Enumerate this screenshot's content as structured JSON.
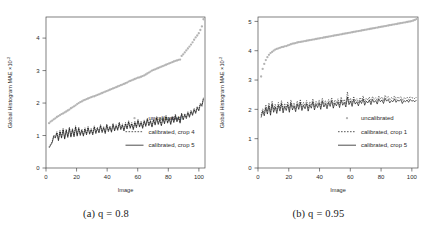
{
  "figure": {
    "panels": [
      {
        "id": "panel-a",
        "caption_label": "(a)",
        "caption_var": "q",
        "caption_eq": "= 0.8",
        "caption_full": "(a) q = 0.8"
      },
      {
        "id": "panel-b",
        "caption_label": "(b)",
        "caption_var": "q",
        "caption_eq": "= 0.95",
        "caption_full": "(b) q = 0.95"
      }
    ]
  },
  "chart_data": [
    {
      "type": "line",
      "panel": "a",
      "title": "",
      "xlabel": "Image",
      "ylabel": "Global Histogram MAE",
      "ylabel_scale": "×10",
      "ylabel_exp": "-2",
      "xlim": [
        0,
        104
      ],
      "ylim": [
        0,
        4.65
      ],
      "xticks": [
        0,
        20,
        40,
        60,
        80,
        100
      ],
      "yticks": [
        0,
        1,
        2,
        3,
        4
      ],
      "grid": false,
      "legend_position": "bottom-right",
      "series": [
        {
          "name": "uncalibrated",
          "style": "points",
          "color": "#b4b4b4",
          "values": [
            1.38,
            1.43,
            1.46,
            1.5,
            1.53,
            1.57,
            1.6,
            1.63,
            1.66,
            1.68,
            1.71,
            1.74,
            1.77,
            1.8,
            1.84,
            1.87,
            1.9,
            1.93,
            1.97,
            2.0,
            2.03,
            2.05,
            2.08,
            2.1,
            2.12,
            2.14,
            2.16,
            2.18,
            2.2,
            2.21,
            2.23,
            2.25,
            2.27,
            2.29,
            2.31,
            2.33,
            2.35,
            2.37,
            2.39,
            2.41,
            2.43,
            2.45,
            2.47,
            2.49,
            2.51,
            2.53,
            2.55,
            2.57,
            2.59,
            2.61,
            2.63,
            2.66,
            2.68,
            2.7,
            2.72,
            2.74,
            2.76,
            2.78,
            2.79,
            2.81,
            2.83,
            2.85,
            2.88,
            2.91,
            2.94,
            2.97,
            3.0,
            3.02,
            3.04,
            3.06,
            3.08,
            3.1,
            3.12,
            3.14,
            3.16,
            3.18,
            3.2,
            3.22,
            3.24,
            3.26,
            3.28,
            3.3,
            3.31,
            3.33,
            3.34,
            3.45,
            3.5,
            3.56,
            3.62,
            3.68,
            3.74,
            3.8,
            3.87,
            3.95,
            4.02,
            4.08,
            4.15,
            4.25,
            4.36,
            4.58
          ]
        },
        {
          "name": "calibrated, crop 4",
          "style": "dotted",
          "color": "#111111",
          "values": [
            0.66,
            0.74,
            0.82,
            1.02,
            0.96,
            1.12,
            0.88,
            1.16,
            0.96,
            1.22,
            0.93,
            1.2,
            0.98,
            1.26,
            0.99,
            1.22,
            1.0,
            1.3,
            1.02,
            1.26,
            1.04,
            1.2,
            1.02,
            1.24,
            1.06,
            1.28,
            1.08,
            1.22,
            1.06,
            1.3,
            1.1,
            1.26,
            1.12,
            1.34,
            1.13,
            1.28,
            1.1,
            1.36,
            1.16,
            1.3,
            1.14,
            1.38,
            1.18,
            1.34,
            1.2,
            1.42,
            1.22,
            1.36,
            1.18,
            1.4,
            1.24,
            1.46,
            1.26,
            1.4,
            1.22,
            1.44,
            1.28,
            1.5,
            1.3,
            1.44,
            1.26,
            1.48,
            1.32,
            1.54,
            1.34,
            1.48,
            1.3,
            1.52,
            1.36,
            1.58,
            1.38,
            1.52,
            1.34,
            1.56,
            1.4,
            1.62,
            1.42,
            1.56,
            1.38,
            1.6,
            1.44,
            1.66,
            1.46,
            1.6,
            1.42,
            1.7,
            1.52,
            1.68,
            1.56,
            1.74,
            1.6,
            1.78,
            1.66,
            1.84,
            1.72,
            1.9,
            1.8,
            2.0,
            1.94,
            2.18
          ]
        },
        {
          "name": "calibrated, crop 5",
          "style": "solid",
          "color": "#000000",
          "values": [
            0.62,
            0.7,
            0.78,
            0.98,
            0.92,
            1.08,
            0.84,
            1.12,
            0.92,
            1.18,
            0.89,
            1.16,
            0.94,
            1.22,
            0.95,
            1.18,
            0.96,
            1.26,
            0.98,
            1.22,
            1.0,
            1.16,
            0.98,
            1.2,
            1.02,
            1.24,
            1.04,
            1.18,
            1.02,
            1.26,
            1.06,
            1.22,
            1.08,
            1.3,
            1.09,
            1.24,
            1.06,
            1.32,
            1.12,
            1.26,
            1.1,
            1.34,
            1.14,
            1.3,
            1.16,
            1.38,
            1.18,
            1.32,
            1.14,
            1.36,
            1.2,
            1.42,
            1.22,
            1.36,
            1.18,
            1.4,
            1.24,
            1.46,
            1.26,
            1.4,
            1.22,
            1.44,
            1.28,
            1.5,
            1.3,
            1.44,
            1.26,
            1.48,
            1.32,
            1.54,
            1.34,
            1.48,
            1.3,
            1.52,
            1.36,
            1.58,
            1.38,
            1.52,
            1.34,
            1.56,
            1.4,
            1.62,
            1.42,
            1.56,
            1.38,
            1.66,
            1.48,
            1.64,
            1.52,
            1.7,
            1.56,
            1.74,
            1.62,
            1.8,
            1.68,
            1.86,
            1.76,
            1.96,
            1.9,
            2.14
          ]
        }
      ]
    },
    {
      "type": "line",
      "panel": "b",
      "title": "",
      "xlabel": "Image",
      "ylabel": "Global Histogram MAE",
      "ylabel_scale": "×10",
      "ylabel_exp": "-2",
      "xlim": [
        0,
        104
      ],
      "ylim": [
        0,
        5.15
      ],
      "xticks": [
        0,
        20,
        40,
        60,
        80,
        100
      ],
      "yticks": [
        0,
        1,
        2,
        3,
        4,
        5
      ],
      "grid": false,
      "legend_position": "bottom-right",
      "series": [
        {
          "name": "uncalibrated",
          "style": "points",
          "color": "#b4b4b4",
          "values": [
            3.12,
            3.38,
            3.55,
            3.68,
            3.78,
            3.86,
            3.92,
            3.96,
            4.0,
            4.04,
            4.06,
            4.08,
            4.1,
            4.12,
            4.13,
            4.15,
            4.16,
            4.18,
            4.2,
            4.22,
            4.24,
            4.25,
            4.26,
            4.28,
            4.29,
            4.3,
            4.31,
            4.32,
            4.33,
            4.34,
            4.35,
            4.36,
            4.37,
            4.38,
            4.39,
            4.4,
            4.41,
            4.42,
            4.43,
            4.44,
            4.45,
            4.46,
            4.47,
            4.48,
            4.49,
            4.5,
            4.51,
            4.52,
            4.53,
            4.54,
            4.55,
            4.56,
            4.57,
            4.58,
            4.59,
            4.6,
            4.61,
            4.62,
            4.63,
            4.64,
            4.65,
            4.66,
            4.67,
            4.68,
            4.69,
            4.7,
            4.71,
            4.72,
            4.73,
            4.74,
            4.75,
            4.76,
            4.77,
            4.78,
            4.79,
            4.8,
            4.81,
            4.82,
            4.83,
            4.84,
            4.85,
            4.86,
            4.87,
            4.88,
            4.89,
            4.9,
            4.91,
            4.92,
            4.93,
            4.94,
            4.95,
            4.96,
            4.97,
            4.98,
            4.99,
            5.0,
            5.01,
            5.03,
            5.05,
            5.08
          ]
        },
        {
          "name": "calibrated, crop 1",
          "style": "dotted",
          "color": "#111111",
          "values": [
            1.8,
            2.02,
            1.88,
            2.16,
            1.94,
            2.22,
            1.9,
            2.28,
            2.0,
            2.18,
            1.96,
            2.24,
            2.04,
            2.3,
            1.98,
            2.2,
            2.06,
            2.26,
            2.0,
            2.32,
            2.08,
            2.22,
            2.02,
            2.28,
            2.1,
            2.34,
            2.06,
            2.24,
            2.12,
            2.3,
            2.04,
            2.26,
            2.14,
            2.36,
            2.08,
            2.28,
            2.16,
            2.32,
            2.1,
            2.38,
            2.18,
            2.3,
            2.12,
            2.34,
            2.2,
            2.4,
            2.14,
            2.32,
            2.22,
            2.36,
            2.16,
            2.42,
            2.24,
            2.34,
            2.18,
            2.6,
            2.26,
            2.38,
            2.2,
            2.44,
            2.28,
            2.36,
            2.22,
            2.4,
            2.3,
            2.46,
            2.24,
            2.38,
            2.32,
            2.42,
            2.26,
            2.44,
            2.34,
            2.4,
            2.28,
            2.46,
            2.36,
            2.42,
            2.3,
            2.48,
            2.38,
            2.44,
            2.32,
            2.4,
            2.36,
            2.46,
            2.34,
            2.42,
            2.38,
            2.44,
            2.3,
            2.4,
            2.36,
            2.42,
            2.34,
            2.44,
            2.38,
            2.4,
            2.36,
            2.42
          ]
        },
        {
          "name": "calibrated, crop 5",
          "style": "solid",
          "color": "#000000",
          "values": [
            1.72,
            1.94,
            1.78,
            2.06,
            1.84,
            2.12,
            1.8,
            2.18,
            1.9,
            2.08,
            1.86,
            2.14,
            1.94,
            2.2,
            1.88,
            2.1,
            1.96,
            2.16,
            1.9,
            2.22,
            1.98,
            2.12,
            1.92,
            2.18,
            2.0,
            2.24,
            1.96,
            2.14,
            2.02,
            2.2,
            1.94,
            2.16,
            2.04,
            2.26,
            1.98,
            2.18,
            2.06,
            2.22,
            2.0,
            2.28,
            2.08,
            2.2,
            2.02,
            2.24,
            2.1,
            2.3,
            2.04,
            2.22,
            2.12,
            2.26,
            2.06,
            2.32,
            2.14,
            2.24,
            2.08,
            2.42,
            2.16,
            2.28,
            2.1,
            2.34,
            2.18,
            2.26,
            2.12,
            2.3,
            2.2,
            2.36,
            2.14,
            2.28,
            2.22,
            2.32,
            2.16,
            2.34,
            2.24,
            2.3,
            2.18,
            2.36,
            2.26,
            2.32,
            2.2,
            2.38,
            2.28,
            2.34,
            2.22,
            2.3,
            2.26,
            2.36,
            2.24,
            2.32,
            2.28,
            2.34,
            2.2,
            2.3,
            2.26,
            2.32,
            2.24,
            2.34,
            2.28,
            2.3,
            2.26,
            2.32
          ]
        }
      ]
    }
  ]
}
